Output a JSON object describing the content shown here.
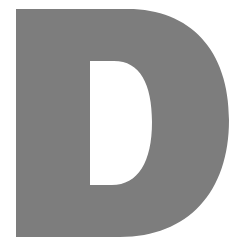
{
  "glyph": {
    "character": "D",
    "fill_color": "#7d7d7d",
    "background_color": "#ffffff"
  }
}
